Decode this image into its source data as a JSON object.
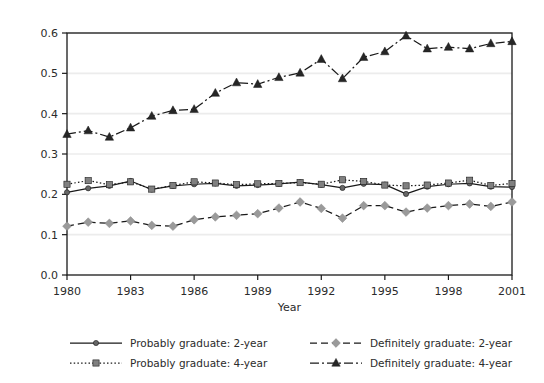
{
  "chart_data": {
    "type": "line",
    "title": "",
    "subtitle": "",
    "xlabel": "Year",
    "ylabel": "",
    "xlim": [
      1980,
      2001
    ],
    "ylim": [
      0.0,
      0.6
    ],
    "grid": "horizontal",
    "legend_position": "bottom",
    "x": [
      1980,
      1981,
      1982,
      1983,
      1984,
      1985,
      1986,
      1987,
      1988,
      1989,
      1990,
      1991,
      1992,
      1993,
      1994,
      1995,
      1996,
      1997,
      1998,
      1999,
      2000,
      2001
    ],
    "xticks": [
      "1980",
      "1983",
      "1986",
      "1989",
      "1992",
      "1995",
      "1998",
      "2001"
    ],
    "yticks": [
      "0.0",
      "0.1",
      "0.2",
      "0.3",
      "0.4",
      "0.5",
      "0.6"
    ],
    "series": [
      {
        "name": "Probably graduate: 2-year",
        "color": "#1a1a1a",
        "marker": "circle",
        "marker_color": "#666666",
        "dash": "solid",
        "values": [
          0.205,
          0.215,
          0.221,
          0.233,
          0.212,
          0.221,
          0.225,
          0.227,
          0.221,
          0.223,
          0.226,
          0.23,
          0.224,
          0.216,
          0.226,
          0.224,
          0.201,
          0.219,
          0.225,
          0.227,
          0.219,
          0.218
        ]
      },
      {
        "name": "Probably graduate: 4-year",
        "color": "#1a1a1a",
        "marker": "square",
        "marker_color": "#808080",
        "dash": "dotted",
        "values": [
          0.225,
          0.234,
          0.224,
          0.231,
          0.213,
          0.222,
          0.231,
          0.228,
          0.224,
          0.226,
          0.227,
          0.229,
          0.225,
          0.236,
          0.232,
          0.223,
          0.221,
          0.223,
          0.228,
          0.235,
          0.222,
          0.227
        ]
      },
      {
        "name": "Definitely graduate: 2-year",
        "color": "#1a1a1a",
        "marker": "diamond",
        "marker_color": "#9a9a9a",
        "dash": "dashed",
        "values": [
          0.121,
          0.131,
          0.128,
          0.134,
          0.123,
          0.121,
          0.137,
          0.144,
          0.148,
          0.152,
          0.166,
          0.181,
          0.165,
          0.141,
          0.172,
          0.172,
          0.156,
          0.166,
          0.172,
          0.176,
          0.17,
          0.181
        ]
      },
      {
        "name": "Definitely graduate: 4-year",
        "color": "#1a1a1a",
        "marker": "triangle",
        "marker_color": "#262626",
        "dash": "dashdot",
        "values": [
          0.349,
          0.358,
          0.342,
          0.365,
          0.394,
          0.408,
          0.411,
          0.451,
          0.477,
          0.473,
          0.49,
          0.501,
          0.535,
          0.487,
          0.54,
          0.554,
          0.593,
          0.561,
          0.565,
          0.561,
          0.574,
          0.579
        ]
      }
    ]
  },
  "legend": {
    "entries": [
      {
        "label": "Probably graduate: 2-year"
      },
      {
        "label": "Definitely graduate: 2-year"
      },
      {
        "label": "Probably graduate: 4-year"
      },
      {
        "label": "Definitely graduate: 4-year"
      }
    ]
  }
}
